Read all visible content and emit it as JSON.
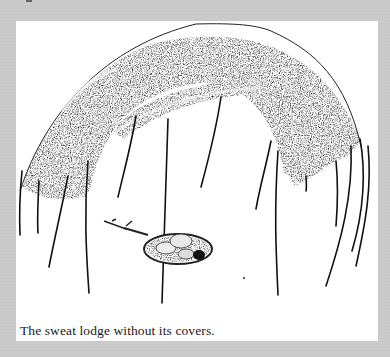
{
  "figure": {
    "caption": "The sweat lodge without its covers.",
    "illustration_subject": "sweat-lodge-frame-drawing",
    "colors": {
      "page_background": "#cbcbcb",
      "plate_background": "#ffffff",
      "ink": "#111111"
    }
  }
}
